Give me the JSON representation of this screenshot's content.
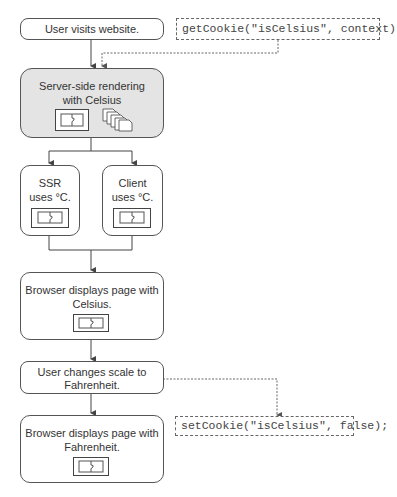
{
  "nodes": {
    "visit": {
      "label": "User visits website."
    },
    "ssr": {
      "label_line1": "Server-side rendering",
      "label_line2": "with Celsius"
    },
    "ssr_uses": {
      "label_line1": "SSR",
      "label_line2": "uses °C."
    },
    "client_uses": {
      "label_line1": "Client",
      "label_line2": "uses °C."
    },
    "browser_celsius": {
      "label_line1": "Browser displays page with",
      "label_line2": "Celsius."
    },
    "user_changes": {
      "label_line1": "User changes scale to",
      "label_line2": "Fahrenheit."
    },
    "browser_fahrenheit": {
      "label_line1": "Browser displays page with",
      "label_line2": "Fahrenheit."
    }
  },
  "code": {
    "get_cookie": "getCookie(\"isCelsius\", context)",
    "set_cookie": "setCookie(\"isCelsius\", false);"
  },
  "icons": {
    "component": "component-puzzle-icon",
    "stack": "page-stack-icon"
  },
  "colors": {
    "stroke": "#555555",
    "highlight_fill": "#e4e4e4",
    "text": "#333333"
  }
}
